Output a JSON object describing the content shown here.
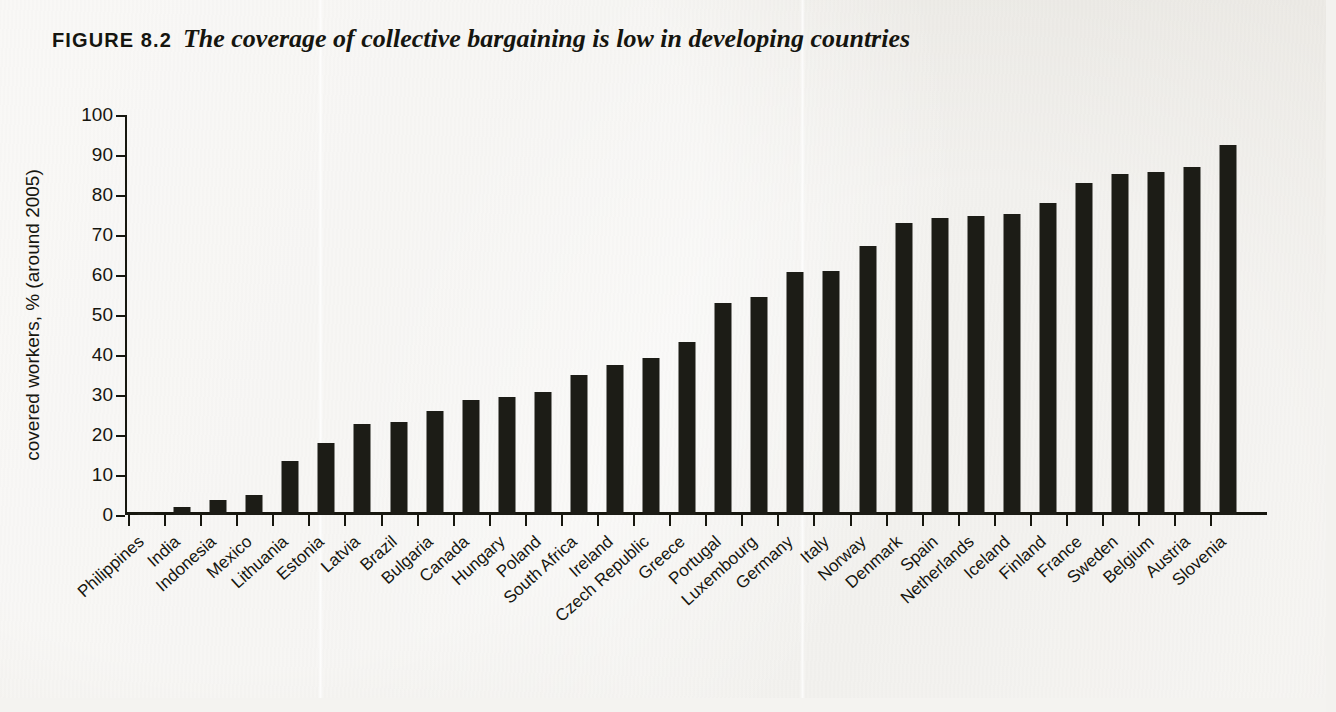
{
  "figure": {
    "label": "FIGURE 8.2",
    "caption": "The coverage of collective bargaining is low in developing countries"
  },
  "chart_data": {
    "type": "bar",
    "title": "The coverage of collective bargaining is low in developing countries",
    "xlabel": "",
    "ylabel": "covered workers, % (around 2005)",
    "ylim": [
      0,
      100
    ],
    "ytick_labels": [
      "0",
      "10",
      "20",
      "30",
      "40",
      "50",
      "60",
      "70",
      "80",
      "90",
      "100"
    ],
    "yticks": [
      0,
      10,
      20,
      30,
      40,
      50,
      60,
      70,
      80,
      90,
      100
    ],
    "grid": false,
    "legend": "none",
    "bar_color": "#1c1c16",
    "categories": [
      "Philippines",
      "India",
      "Indonesia",
      "Mexico",
      "Lithuania",
      "Estonia",
      "Latvia",
      "Brazil",
      "Bulgaria",
      "Canada",
      "Hungary",
      "Poland",
      "South Africa",
      "Ireland",
      "Czech Republic",
      "Greece",
      "Portugal",
      "Luxembourg",
      "Germany",
      "Italy",
      "Norway",
      "Denmark",
      "Spain",
      "Netherlands",
      "Iceland",
      "Finland",
      "France",
      "Sweden",
      "Belgium",
      "Austria",
      "Slovenia"
    ],
    "values": [
      0.5,
      2,
      3.7,
      5,
      13.5,
      18,
      22.8,
      23.2,
      26,
      28.7,
      29.5,
      30.7,
      35.1,
      37.5,
      39.2,
      43.3,
      53,
      54.5,
      60.7,
      61,
      67.2,
      73,
      74.2,
      74.7,
      75.2,
      78,
      83,
      85.3,
      85.7,
      87,
      92.5
    ]
  }
}
